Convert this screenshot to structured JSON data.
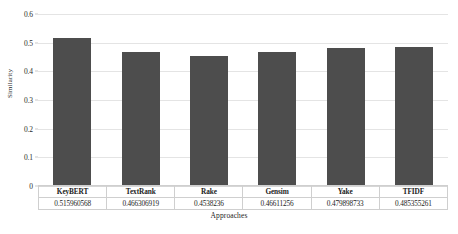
{
  "chart_data": {
    "type": "bar",
    "title": "",
    "xlabel": "Approaches",
    "ylabel": "Similarity",
    "categories": [
      "KeyBERT",
      "TextRank",
      "Rake",
      "Gensim",
      "Yake",
      "TFIDF"
    ],
    "values": [
      0.515960568,
      0.466306919,
      0.4538236,
      0.46611256,
      0.479898733,
      0.485355261
    ],
    "value_labels": [
      "0.515960568",
      "0.466306919",
      "0.4538236",
      "0.46611256",
      "0.479898733",
      "0.485355261"
    ],
    "ylim": [
      0,
      0.6
    ],
    "ytick_labels": [
      "0",
      "0.1",
      "0.2",
      "0.3",
      "0.4",
      "0.5",
      "0.6"
    ],
    "ytick_values": [
      0,
      0.1,
      0.2,
      0.3,
      0.4,
      0.5,
      0.6
    ],
    "grid": true,
    "legend": false,
    "bar_color": "#4d4d4d",
    "grid_color": "#e4e4e4",
    "has_data_table": true
  }
}
